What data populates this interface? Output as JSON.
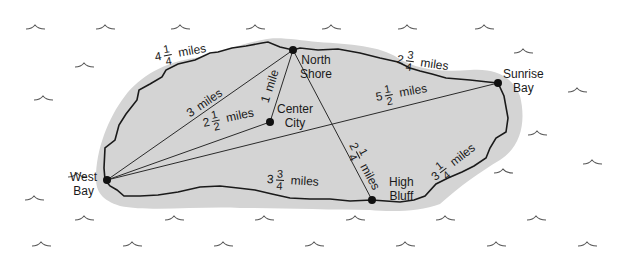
{
  "diagram": {
    "type": "island-map",
    "colors": {
      "land": "#d3d3d3",
      "coast": "#1a1a1a",
      "route": "#2a2a2a",
      "wave": "#555555",
      "sea": "#ffffff"
    }
  },
  "places": {
    "north_shore": {
      "line1": "North",
      "line2": "Shore"
    },
    "sunrise_bay": {
      "line1": "Sunrise",
      "line2": "Bay"
    },
    "center_city": {
      "line1": "Center",
      "line2": "City"
    },
    "west_bay": {
      "line1": "West",
      "line2": "Bay"
    },
    "high_bluff": {
      "line1": "High",
      "line2": "Bluff"
    }
  },
  "distances": {
    "west_bay_to_north_shore_coast": {
      "whole": "4",
      "num": "1",
      "den": "4",
      "unit": "miles"
    },
    "north_shore_to_sunrise_bay_coast": {
      "whole": "2",
      "num": "3",
      "den": "4",
      "unit": "miles"
    },
    "west_bay_to_north_shore": {
      "whole": "3",
      "unit": "miles"
    },
    "north_shore_to_center_city": {
      "whole": "1",
      "unit": "mile"
    },
    "west_bay_to_center_city": {
      "whole": "2",
      "num": "1",
      "den": "2",
      "unit": "miles"
    },
    "west_bay_to_sunrise_bay": {
      "whole": "5",
      "num": "1",
      "den": "2",
      "unit": "miles"
    },
    "north_shore_to_high_bluff": {
      "whole": "2",
      "num": "1",
      "den": "4",
      "unit": "miles"
    },
    "west_bay_to_high_bluff_coast": {
      "whole": "3",
      "num": "3",
      "den": "4",
      "unit": "miles"
    },
    "high_bluff_to_sunrise_bay_coast": {
      "whole": "3",
      "num": "1",
      "den": "4",
      "unit": "miles"
    }
  }
}
